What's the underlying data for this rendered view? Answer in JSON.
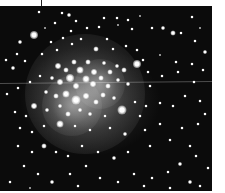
{
  "image": {
    "subject": "open star cluster",
    "colors": {
      "background": "#0b0b0b",
      "star": "#ffffff",
      "margin": "#ffffff"
    },
    "glows": [
      {
        "x": 85,
        "y": 88,
        "r": 60
      },
      {
        "x": 72,
        "y": 100,
        "r": 30
      },
      {
        "x": 100,
        "y": 78,
        "r": 25
      }
    ],
    "stars": [
      {
        "x": 34,
        "y": 29,
        "s": 8
      },
      {
        "x": 20,
        "y": 36,
        "s": 4
      },
      {
        "x": 62,
        "y": 7,
        "s": 3
      },
      {
        "x": 69,
        "y": 9,
        "s": 4
      },
      {
        "x": 39,
        "y": 6,
        "s": 3
      },
      {
        "x": 55,
        "y": 17,
        "s": 3
      },
      {
        "x": 76,
        "y": 15,
        "s": 3
      },
      {
        "x": 71,
        "y": 25,
        "s": 3
      },
      {
        "x": 45,
        "y": 22,
        "s": 2
      },
      {
        "x": 87,
        "y": 22,
        "s": 3
      },
      {
        "x": 99,
        "y": 21,
        "s": 3
      },
      {
        "x": 104,
        "y": 12,
        "s": 3
      },
      {
        "x": 117,
        "y": 12,
        "s": 3
      },
      {
        "x": 128,
        "y": 14,
        "s": 3
      },
      {
        "x": 132,
        "y": 23,
        "s": 3
      },
      {
        "x": 152,
        "y": 22,
        "s": 3
      },
      {
        "x": 163,
        "y": 22,
        "s": 4
      },
      {
        "x": 173,
        "y": 27,
        "s": 5
      },
      {
        "x": 181,
        "y": 27,
        "s": 3
      },
      {
        "x": 192,
        "y": 11,
        "s": 3
      },
      {
        "x": 200,
        "y": 22,
        "s": 2
      },
      {
        "x": 195,
        "y": 35,
        "s": 3
      },
      {
        "x": 205,
        "y": 46,
        "s": 4
      },
      {
        "x": 118,
        "y": 19,
        "s": 2
      },
      {
        "x": 140,
        "y": 10,
        "s": 2
      },
      {
        "x": 17,
        "y": 48,
        "s": 3
      },
      {
        "x": 6,
        "y": 54,
        "s": 3
      },
      {
        "x": 13,
        "y": 62,
        "s": 4
      },
      {
        "x": 25,
        "y": 55,
        "s": 3
      },
      {
        "x": 42,
        "y": 48,
        "s": 3
      },
      {
        "x": 51,
        "y": 36,
        "s": 3
      },
      {
        "x": 57,
        "y": 44,
        "s": 3
      },
      {
        "x": 63,
        "y": 32,
        "s": 3
      },
      {
        "x": 72,
        "y": 38,
        "s": 3
      },
      {
        "x": 81,
        "y": 33,
        "s": 3
      },
      {
        "x": 96,
        "y": 43,
        "s": 5
      },
      {
        "x": 107,
        "y": 33,
        "s": 3
      },
      {
        "x": 113,
        "y": 43,
        "s": 3
      },
      {
        "x": 126,
        "y": 40,
        "s": 3
      },
      {
        "x": 137,
        "y": 44,
        "s": 3
      },
      {
        "x": 143,
        "y": 54,
        "s": 3
      },
      {
        "x": 160,
        "y": 49,
        "s": 2
      },
      {
        "x": 176,
        "y": 56,
        "s": 3
      },
      {
        "x": 192,
        "y": 58,
        "s": 3
      },
      {
        "x": 203,
        "y": 64,
        "s": 3
      },
      {
        "x": 58,
        "y": 60,
        "s": 6
      },
      {
        "x": 66,
        "y": 64,
        "s": 5
      },
      {
        "x": 74,
        "y": 56,
        "s": 5
      },
      {
        "x": 80,
        "y": 64,
        "s": 7
      },
      {
        "x": 88,
        "y": 56,
        "s": 5
      },
      {
        "x": 94,
        "y": 66,
        "s": 6
      },
      {
        "x": 104,
        "y": 57,
        "s": 4
      },
      {
        "x": 110,
        "y": 66,
        "s": 5
      },
      {
        "x": 117,
        "y": 60,
        "s": 4
      },
      {
        "x": 124,
        "y": 64,
        "s": 5
      },
      {
        "x": 137,
        "y": 58,
        "s": 8
      },
      {
        "x": 148,
        "y": 66,
        "s": 3
      },
      {
        "x": 162,
        "y": 70,
        "s": 3
      },
      {
        "x": 178,
        "y": 66,
        "s": 3
      },
      {
        "x": 194,
        "y": 76,
        "s": 3
      },
      {
        "x": 52,
        "y": 72,
        "s": 4
      },
      {
        "x": 60,
        "y": 76,
        "s": 6
      },
      {
        "x": 70,
        "y": 72,
        "s": 8
      },
      {
        "x": 76,
        "y": 80,
        "s": 6
      },
      {
        "x": 86,
        "y": 73,
        "s": 7
      },
      {
        "x": 93,
        "y": 78,
        "s": 6
      },
      {
        "x": 101,
        "y": 72,
        "s": 5
      },
      {
        "x": 108,
        "y": 80,
        "s": 5
      },
      {
        "x": 118,
        "y": 74,
        "s": 4
      },
      {
        "x": 128,
        "y": 78,
        "s": 4
      },
      {
        "x": 40,
        "y": 70,
        "s": 3
      },
      {
        "x": 30,
        "y": 76,
        "s": 3
      },
      {
        "x": 18,
        "y": 82,
        "s": 3
      },
      {
        "x": 7,
        "y": 88,
        "s": 3
      },
      {
        "x": 150,
        "y": 80,
        "s": 3
      },
      {
        "x": 46,
        "y": 86,
        "s": 4
      },
      {
        "x": 56,
        "y": 90,
        "s": 5
      },
      {
        "x": 66,
        "y": 88,
        "s": 7
      },
      {
        "x": 76,
        "y": 94,
        "s": 9
      },
      {
        "x": 86,
        "y": 90,
        "s": 6
      },
      {
        "x": 96,
        "y": 96,
        "s": 5
      },
      {
        "x": 103,
        "y": 89,
        "s": 5
      },
      {
        "x": 114,
        "y": 92,
        "s": 4
      },
      {
        "x": 122,
        "y": 104,
        "s": 9
      },
      {
        "x": 135,
        "y": 96,
        "s": 3
      },
      {
        "x": 146,
        "y": 100,
        "s": 3
      },
      {
        "x": 160,
        "y": 97,
        "s": 3
      },
      {
        "x": 173,
        "y": 100,
        "s": 3
      },
      {
        "x": 185,
        "y": 90,
        "s": 3
      },
      {
        "x": 200,
        "y": 95,
        "s": 3
      },
      {
        "x": 34,
        "y": 100,
        "s": 6
      },
      {
        "x": 26,
        "y": 110,
        "s": 3
      },
      {
        "x": 15,
        "y": 106,
        "s": 3
      },
      {
        "x": 47,
        "y": 104,
        "s": 4
      },
      {
        "x": 60,
        "y": 100,
        "s": 4
      },
      {
        "x": 68,
        "y": 108,
        "s": 5
      },
      {
        "x": 80,
        "y": 104,
        "s": 4
      },
      {
        "x": 90,
        "y": 108,
        "s": 4
      },
      {
        "x": 105,
        "y": 110,
        "s": 3
      },
      {
        "x": 140,
        "y": 110,
        "s": 3
      },
      {
        "x": 60,
        "y": 118,
        "s": 7
      },
      {
        "x": 44,
        "y": 120,
        "s": 3
      },
      {
        "x": 32,
        "y": 126,
        "s": 3
      },
      {
        "x": 20,
        "y": 122,
        "s": 3
      },
      {
        "x": 75,
        "y": 120,
        "s": 3
      },
      {
        "x": 90,
        "y": 124,
        "s": 3
      },
      {
        "x": 110,
        "y": 122,
        "s": 3
      },
      {
        "x": 125,
        "y": 128,
        "s": 4
      },
      {
        "x": 145,
        "y": 124,
        "s": 3
      },
      {
        "x": 160,
        "y": 118,
        "s": 3
      },
      {
        "x": 182,
        "y": 122,
        "s": 3
      },
      {
        "x": 198,
        "y": 118,
        "s": 3
      },
      {
        "x": 205,
        "y": 108,
        "s": 3
      },
      {
        "x": 170,
        "y": 134,
        "s": 3
      },
      {
        "x": 190,
        "y": 140,
        "s": 3
      },
      {
        "x": 44,
        "y": 140,
        "s": 5
      },
      {
        "x": 56,
        "y": 146,
        "s": 3
      },
      {
        "x": 32,
        "y": 146,
        "s": 3
      },
      {
        "x": 18,
        "y": 140,
        "s": 3
      },
      {
        "x": 68,
        "y": 150,
        "s": 3
      },
      {
        "x": 82,
        "y": 140,
        "s": 3
      },
      {
        "x": 98,
        "y": 146,
        "s": 3
      },
      {
        "x": 114,
        "y": 152,
        "s": 4
      },
      {
        "x": 128,
        "y": 146,
        "s": 3
      },
      {
        "x": 150,
        "y": 140,
        "s": 3
      },
      {
        "x": 180,
        "y": 158,
        "s": 4
      },
      {
        "x": 196,
        "y": 150,
        "s": 3
      },
      {
        "x": 208,
        "y": 162,
        "s": 3
      },
      {
        "x": 168,
        "y": 166,
        "s": 3
      },
      {
        "x": 152,
        "y": 172,
        "s": 3
      },
      {
        "x": 24,
        "y": 160,
        "s": 3
      },
      {
        "x": 38,
        "y": 168,
        "s": 3
      },
      {
        "x": 52,
        "y": 176,
        "s": 4
      },
      {
        "x": 70,
        "y": 168,
        "s": 3
      },
      {
        "x": 86,
        "y": 160,
        "s": 3
      },
      {
        "x": 100,
        "y": 172,
        "s": 3
      },
      {
        "x": 118,
        "y": 176,
        "s": 3
      },
      {
        "x": 134,
        "y": 168,
        "s": 3
      },
      {
        "x": 190,
        "y": 176,
        "s": 4
      },
      {
        "x": 200,
        "y": 180,
        "s": 3
      },
      {
        "x": 10,
        "y": 176,
        "s": 3
      },
      {
        "x": 78,
        "y": 180,
        "s": 3
      },
      {
        "x": 144,
        "y": 180,
        "s": 3
      },
      {
        "x": 170,
        "y": 182,
        "s": 3
      },
      {
        "x": 30,
        "y": 182,
        "s": 2
      }
    ]
  }
}
